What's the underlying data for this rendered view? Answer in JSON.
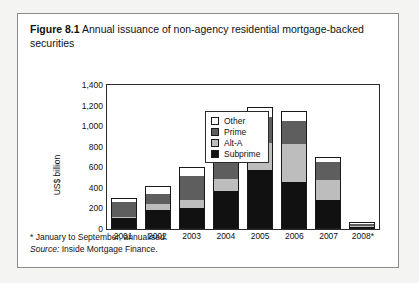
{
  "figure": {
    "number": "Figure 8.1",
    "title": "Annual issuance of non-agency residential mortgage-backed securities"
  },
  "notes": {
    "footnote": "* January to September, annualised.",
    "source_label": "Source:",
    "source_value": "Inside Mortgage Finance."
  },
  "legend": {
    "position": "top-left-inside",
    "items": [
      {
        "label": "Other",
        "color": "#ffffff"
      },
      {
        "label": "Prime",
        "color": "#5e5e5e"
      },
      {
        "label": "Alt-A",
        "color": "#bdbdbd"
      },
      {
        "label": "Subprime",
        "color": "#111111"
      }
    ]
  },
  "chart_data": {
    "type": "bar",
    "stacked": true,
    "title": "Annual issuance of non-agency residential mortgage-backed securities",
    "xlabel": "",
    "ylabel": "US$ billion",
    "ylim": [
      0,
      1400
    ],
    "yticks": [
      0,
      200,
      400,
      600,
      800,
      1000,
      1200,
      1400
    ],
    "ytick_labels": [
      "0",
      "200",
      "400",
      "600",
      "800",
      "1,000",
      "1,200",
      "1,400"
    ],
    "grid": false,
    "categories": [
      "2001",
      "2002",
      "2003",
      "2004",
      "2005",
      "2006",
      "2007",
      "2008*"
    ],
    "series": [
      {
        "name": "Subprime",
        "color": "#111111",
        "values": [
          95,
          175,
          195,
          360,
          565,
          450,
          270,
          12
        ]
      },
      {
        "name": "Alt-A",
        "color": "#bdbdbd",
        "values": [
          15,
          55,
          75,
          115,
          265,
          365,
          195,
          6
        ]
      },
      {
        "name": "Prime",
        "color": "#5e5e5e",
        "values": [
          140,
          105,
          240,
          295,
          250,
          230,
          175,
          22
        ]
      },
      {
        "name": "Other",
        "color": "#ffffff",
        "values": [
          35,
          65,
          75,
          75,
          85,
          85,
          40,
          10
        ]
      }
    ],
    "totals": [
      285,
      400,
      585,
      845,
      1165,
      1130,
      680,
      50
    ],
    "annotations": [
      "* January to September, annualised."
    ]
  }
}
